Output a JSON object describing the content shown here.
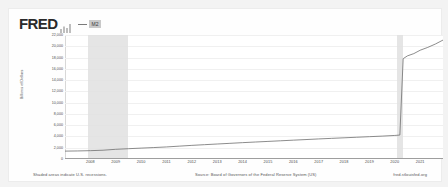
{
  "brand": {
    "logo_text": "FRED",
    "chart_icon": "mini-bar-chart-icon"
  },
  "legend": {
    "series_label": "M2",
    "line_color": "#7a7a7a"
  },
  "footer": {
    "recession_note": "Shaded areas indicate U.S. recessions.",
    "source": "Source: Board of Governors of the Federal Reserve System (US)",
    "attribution": "fred.stlouisfed.org"
  },
  "colors": {
    "line": "#6e6e6e",
    "recession_band": "#e0e0e0",
    "grid": "#f0f0f0",
    "axis": "#9e9e9e",
    "page_bg": "#f3f3f3",
    "card_bg": "#fefefe"
  },
  "chart_data": {
    "type": "line",
    "title": "",
    "xlabel": "",
    "ylabel": "Billions of Dollars",
    "ylim": [
      0,
      22000
    ],
    "xlim": [
      2007.0,
      2021.9
    ],
    "grid": true,
    "legend_position": "top-left",
    "ytick_labels": [
      "22,000",
      "20,000",
      "18,000",
      "16,000",
      "14,000",
      "12,000",
      "10,000",
      "8,000",
      "6,000",
      "4,000",
      "2,000",
      "0"
    ],
    "ytick_values": [
      22000,
      20000,
      18000,
      16000,
      14000,
      12000,
      10000,
      8000,
      6000,
      4000,
      2000,
      0
    ],
    "xtick_labels": [
      "2008",
      "2009",
      "2010",
      "2011",
      "2012",
      "2013",
      "2014",
      "2015",
      "2016",
      "2017",
      "2018",
      "2019",
      "2020",
      "2021"
    ],
    "xtick_values": [
      2008,
      2009,
      2010,
      2011,
      2012,
      2013,
      2014,
      2015,
      2016,
      2017,
      2018,
      2019,
      2020,
      2021
    ],
    "recessions": [
      {
        "start": 2007.92,
        "end": 2009.5,
        "label": "Great Recession"
      },
      {
        "start": 2020.08,
        "end": 2020.33,
        "label": "COVID-19 Recession"
      }
    ],
    "series": [
      {
        "name": "M2",
        "color": "#6e6e6e",
        "x": [
          2007.0,
          2007.5,
          2008.0,
          2008.5,
          2009.0,
          2009.5,
          2010.0,
          2010.5,
          2011.0,
          2011.5,
          2012.0,
          2012.5,
          2013.0,
          2013.5,
          2014.0,
          2014.5,
          2015.0,
          2015.5,
          2016.0,
          2016.5,
          2017.0,
          2017.5,
          2018.0,
          2018.5,
          2019.0,
          2019.5,
          2020.0,
          2020.2,
          2020.33,
          2020.5,
          2020.75,
          2021.0,
          2021.3,
          2021.6,
          2021.9
        ],
        "y": [
          1400,
          1430,
          1480,
          1560,
          1720,
          1830,
          1930,
          2030,
          2140,
          2280,
          2420,
          2540,
          2660,
          2780,
          2900,
          3010,
          3120,
          3230,
          3340,
          3450,
          3560,
          3660,
          3760,
          3860,
          3960,
          4060,
          4180,
          4250,
          17800,
          18300,
          18700,
          19300,
          19800,
          20400,
          21100
        ]
      }
    ]
  }
}
